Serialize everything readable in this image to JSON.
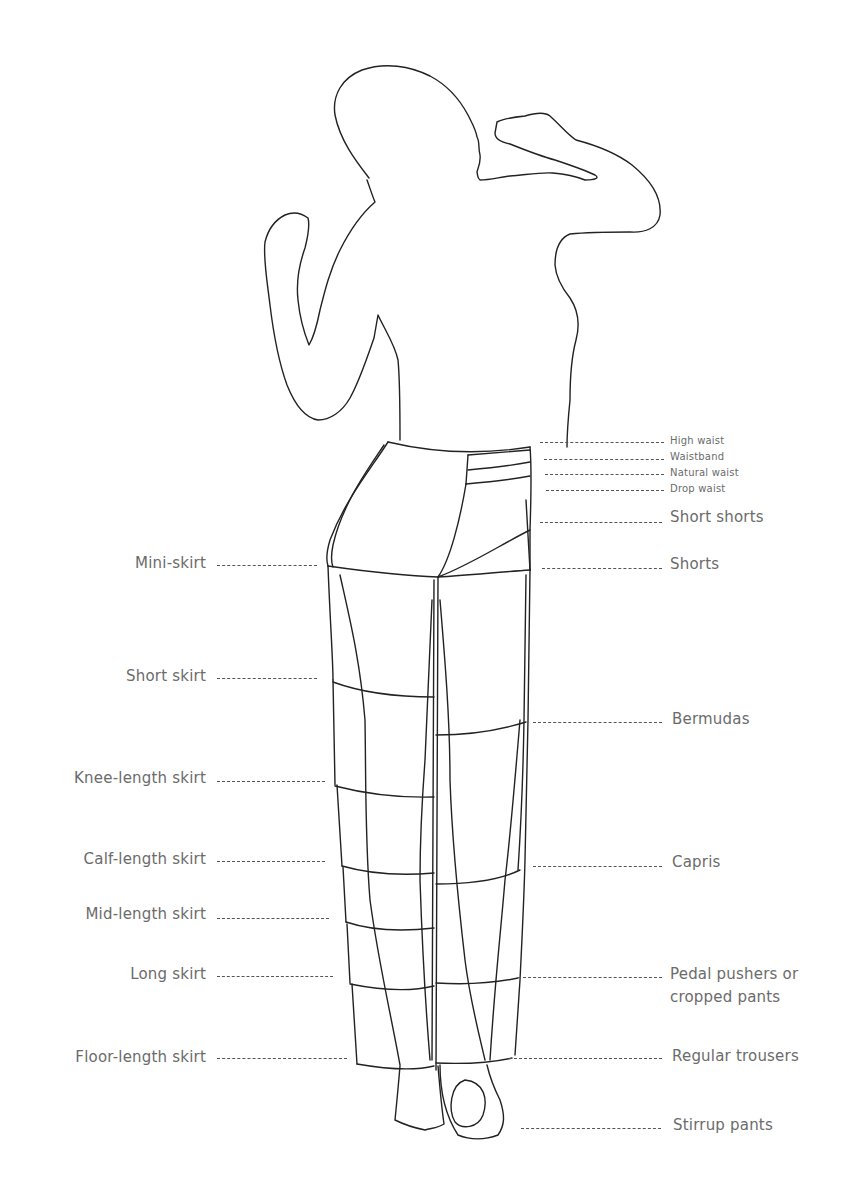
{
  "diagram": {
    "line_color": "#222222",
    "label_color": "#6b6b6b",
    "left_labels": [
      {
        "text": "Mini-skirt",
        "y": 564
      },
      {
        "text": "Short skirt",
        "y": 677
      },
      {
        "text": "Knee-length skirt",
        "y": 779
      },
      {
        "text": "Calf-length skirt",
        "y": 860
      },
      {
        "text": "Mid-length skirt",
        "y": 915
      },
      {
        "text": "Long skirt",
        "y": 975
      },
      {
        "text": "Floor-length skirt",
        "y": 1058
      }
    ],
    "right_labels_small": [
      {
        "text": "High waist",
        "y": 441
      },
      {
        "text": "Waistband",
        "y": 457
      },
      {
        "text": "Natural waist",
        "y": 473
      },
      {
        "text": "Drop waist",
        "y": 489
      }
    ],
    "right_labels": [
      {
        "text": "Short shorts",
        "y": 519
      },
      {
        "text": "Shorts",
        "y": 565
      },
      {
        "text": "Bermudas",
        "y": 720
      },
      {
        "text": "Capris",
        "y": 864
      },
      {
        "text": "Pedal pushers or",
        "text2": "cropped pants",
        "y": 975
      },
      {
        "text": "Regular trousers",
        "y": 1057
      },
      {
        "text": "Stirrup pants",
        "y": 1127
      }
    ]
  }
}
